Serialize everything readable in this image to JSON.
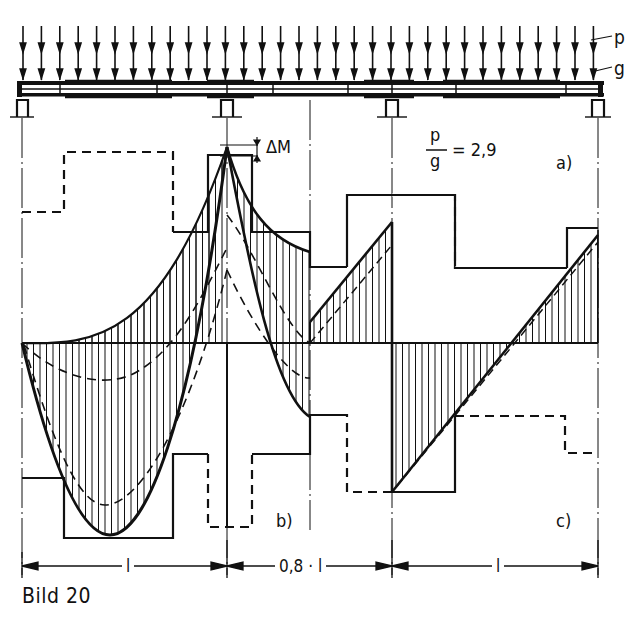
{
  "figure": {
    "caption": "Bild 20",
    "load_labels": {
      "live_load": "p",
      "dead_load": "g"
    },
    "ratio": {
      "numerator": "p",
      "denominator": "g",
      "equals": "= 2,9"
    },
    "delta_m_label": "ΔM",
    "panels": {
      "a": "a)",
      "b": "b)",
      "c": "c)"
    },
    "spans": [
      {
        "label": "l"
      },
      {
        "label": "0,8 · l"
      },
      {
        "label": "l"
      }
    ],
    "structure": "three-span continuous beam with uniform loads p and g, four supports",
    "diagrams": {
      "b": "bending moment envelope (hatched) with max/min curves, dashed alternative curves, stepped reinforcement lines",
      "c": "shear force envelope (hatched) with stepped lines"
    }
  },
  "colors": {
    "ink": "#111111",
    "paper": "#ffffff"
  }
}
